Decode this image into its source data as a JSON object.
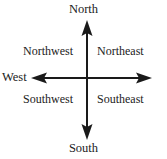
{
  "diagram": {
    "type": "compass-rose-axes",
    "background_color": "#ffffff",
    "line_color": "#1a1a1a",
    "text_color": "#222222",
    "axes": {
      "vertical": {
        "x": 87,
        "y_top": 20,
        "y_bottom": 140,
        "stroke_width": 2,
        "arrow_top": true,
        "arrow_bottom": true
      },
      "horizontal": {
        "y": 78,
        "x_left": 31,
        "x_right": 152,
        "stroke_width": 2,
        "arrow_left": true,
        "arrow_right": true
      }
    },
    "cardinal_labels": {
      "north": "North",
      "south": "South",
      "west": "West"
    },
    "quadrant_labels": {
      "northwest": "Northwest",
      "northeast": "Northeast",
      "southwest": "Southwest",
      "southeast": "Southeast"
    }
  }
}
